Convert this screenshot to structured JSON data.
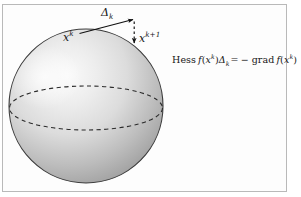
{
  "figure": {
    "domain": "diagram",
    "caption_present": false,
    "frame": {
      "border_color": "#b9b9b9",
      "background_color": "#fdfdfd"
    },
    "sphere": {
      "name": "manifold-sphere",
      "center_x": 86,
      "center_y": 106,
      "radius": 77,
      "fill_light": "#f2f2f2",
      "fill_mid": "#c9c9c9",
      "fill_dark": "#8e8e8e",
      "outline_color": "#3a3a3a",
      "equator_style": "dashed",
      "equator_color": "#2e2e2e"
    },
    "tangent_vector": {
      "name": "tangent-step-arrow",
      "label": "Δ",
      "label_sub": "k",
      "from_x": 79,
      "from_y": 33,
      "to_x": 134,
      "to_y": 19,
      "color": "#111111"
    },
    "retraction": {
      "name": "retraction-arrow",
      "style": "dashed",
      "from_x": 134,
      "from_y": 21,
      "to_x": 134,
      "to_y": 45,
      "color": "#111111"
    },
    "points": {
      "current": {
        "label": "x",
        "sup": "k",
        "x": 63,
        "y": 32
      },
      "next": {
        "label": "x",
        "sup": "k+1",
        "x": 139,
        "y": 33
      }
    },
    "equation": {
      "name": "newton-equation",
      "text": "Hess f(xᵏ)Δₖ = − grad f(xᵏ)",
      "parts": {
        "hess": "Hess",
        "f1": "f",
        "open1": "(",
        "x1": "x",
        "sup1": "k",
        "close1": ")",
        "delta": "Δ",
        "delta_sub": "k",
        "equals": "=",
        "minus": "−",
        "grad": "grad",
        "f2": "f",
        "open2": "(",
        "x2": "x",
        "sup2": "k",
        "close2": ")"
      }
    }
  }
}
